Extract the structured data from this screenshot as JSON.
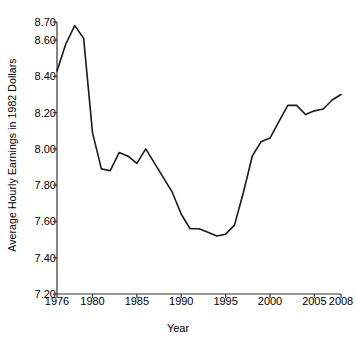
{
  "chart_data": {
    "type": "line",
    "title": "",
    "xlabel": "Year",
    "ylabel": "Average Hourly Earnings in 1982 Dollars",
    "xlim": [
      1976,
      2008
    ],
    "ylim": [
      7.2,
      8.7
    ],
    "grid": false,
    "legend": null,
    "y_ticks": [
      "8.70",
      "8.60",
      "8.40",
      "8.20",
      "8.00",
      "7.80",
      "7.60",
      "7.40",
      "7.20"
    ],
    "y_tick_values": [
      8.7,
      8.6,
      8.4,
      8.2,
      8.0,
      7.8,
      7.6,
      7.4,
      7.2
    ],
    "x_ticks": [
      "1976",
      "1980",
      "1985",
      "1990",
      "1995",
      "2000",
      "2005",
      "2008"
    ],
    "x_tick_values": [
      1976,
      1980,
      1985,
      1990,
      1995,
      2000,
      2005,
      2008
    ],
    "line_color": "#1a1a1a",
    "x": [
      1976,
      1977,
      1978,
      1979,
      1980,
      1981,
      1982,
      1983,
      1984,
      1985,
      1986,
      1987,
      1988,
      1989,
      1990,
      1991,
      1992,
      1993,
      1994,
      1995,
      1996,
      1997,
      1998,
      1999,
      2000,
      2001,
      2002,
      2003,
      2004,
      2005,
      2006,
      2007,
      2008
    ],
    "values": [
      8.43,
      8.58,
      8.68,
      8.61,
      8.09,
      7.89,
      7.88,
      7.98,
      7.96,
      7.92,
      8.0,
      7.92,
      7.84,
      7.76,
      7.64,
      7.56,
      7.56,
      7.54,
      7.52,
      7.53,
      7.58,
      7.76,
      7.96,
      8.04,
      8.06,
      8.15,
      8.24,
      8.24,
      8.19,
      8.21,
      8.22,
      8.27,
      8.3
    ]
  }
}
